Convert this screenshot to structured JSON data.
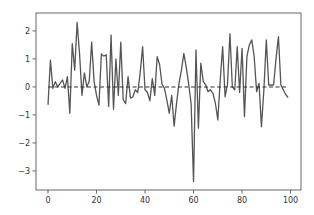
{
  "chart_data": {
    "type": "line",
    "title": "",
    "xlabel": "",
    "ylabel": "",
    "xlim": [
      -4.95,
      104.3
    ],
    "ylim": [
      -3.68,
      2.64
    ],
    "grid": false,
    "legend": null,
    "x_ticks": [
      0,
      20,
      40,
      60,
      80,
      100
    ],
    "x_tick_labels": [
      "0",
      "20",
      "40",
      "60",
      "80",
      "100"
    ],
    "y_ticks": [
      2,
      1,
      0,
      -1,
      -2,
      -3
    ],
    "y_tick_labels": [
      "2",
      "1",
      "0",
      "−1",
      "−2",
      "−3"
    ],
    "series": [
      {
        "name": "signal",
        "style": "solid",
        "color": "#555555",
        "x": [
          0,
          1,
          2,
          3,
          4,
          5,
          6,
          7,
          8,
          9,
          10,
          11,
          12,
          13,
          14,
          15,
          16,
          17,
          18,
          19,
          20,
          21,
          22,
          23,
          24,
          25,
          26,
          27,
          28,
          29,
          30,
          31,
          32,
          33,
          34,
          35,
          36,
          37,
          38,
          39,
          40,
          41,
          42,
          43,
          44,
          45,
          46,
          47,
          48,
          49,
          50,
          51,
          52,
          53,
          54,
          55,
          56,
          57,
          58,
          59,
          60,
          61,
          62,
          63,
          64,
          65,
          66,
          67,
          68,
          69,
          70,
          71,
          72,
          73,
          74,
          75,
          76,
          77,
          78,
          79,
          80,
          81,
          82,
          83,
          84,
          85,
          86,
          87,
          88,
          89,
          90,
          91,
          92,
          93,
          94,
          95,
          96,
          97,
          98,
          99
        ],
        "values": [
          -0.64,
          0.96,
          -0.05,
          0.19,
          0.0,
          0.13,
          0.25,
          -0.05,
          0.37,
          -0.94,
          1.55,
          0.6,
          2.3,
          1.2,
          -0.3,
          0.5,
          0.0,
          0.2,
          1.6,
          0.2,
          -0.3,
          -0.65,
          1.18,
          1.1,
          1.15,
          -0.7,
          1.85,
          -0.8,
          1.0,
          -0.3,
          1.6,
          -0.45,
          -0.6,
          0.37,
          -0.4,
          -0.35,
          -0.1,
          -0.2,
          0.5,
          1.44,
          -0.1,
          -0.2,
          -0.5,
          0.3,
          -0.3,
          1.08,
          0.8,
          0.1,
          -0.05,
          -0.46,
          -0.94,
          -0.3,
          -1.4,
          -0.58,
          0.13,
          0.6,
          1.2,
          0.7,
          0.1,
          -0.6,
          -3.38,
          1.32,
          -1.47,
          0.85,
          0.2,
          0.07,
          -0.17,
          -0.1,
          -0.23,
          -0.58,
          -1.18,
          0.25,
          1.44,
          -0.35,
          0.1,
          1.9,
          0.0,
          -0.1,
          1.44,
          -0.2,
          1.38,
          -1.06,
          1.08,
          1.5,
          1.68,
          1.08,
          -0.17,
          0.13,
          -1.42,
          -0.1,
          1.68,
          0.07,
          0.07,
          0.07,
          1.0,
          1.8,
          0.07,
          -0.1,
          -0.27,
          -0.38
        ]
      },
      {
        "name": "mean",
        "style": "dashed",
        "color": "#333333",
        "x": [
          0,
          99
        ],
        "values": [
          0.0,
          0.0
        ]
      }
    ]
  },
  "colors": {
    "line": "#555555",
    "mean_line": "#333333",
    "axes": "#444444",
    "background": "#ffffff"
  }
}
